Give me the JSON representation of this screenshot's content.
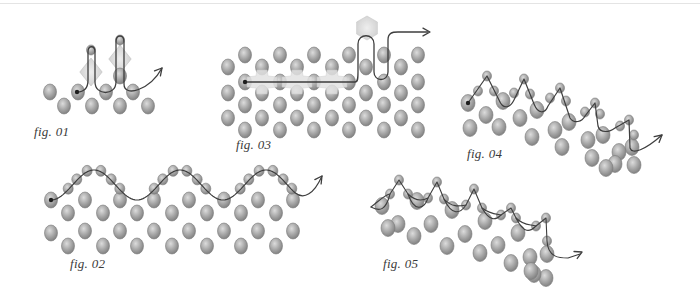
{
  "colors": {
    "bead_light": "#d6d6d6",
    "bead_mid": "#a4a4a4",
    "bead_dark": "#7a7a7a",
    "thread": "#3e3e3e",
    "crystal": "#d9d9d9",
    "background": "#ffffff"
  },
  "figures": [
    {
      "id": "fig01",
      "label": "fig. 01",
      "label_pos": [
        34,
        124
      ],
      "beads": [
        [
          50,
          92
        ],
        [
          78,
          92
        ],
        [
          106,
          92
        ],
        [
          133,
          92
        ],
        [
          64,
          106
        ],
        [
          92,
          106
        ],
        [
          120,
          106
        ],
        [
          148,
          106
        ],
        [
          120,
          76
        ]
      ],
      "small_beads": [
        [
          91,
          50
        ],
        [
          120,
          40
        ]
      ],
      "crystals": [
        [
          91,
          72,
          14
        ],
        [
          120,
          59,
          14
        ]
      ],
      "thread": "M77,92 C84,92 88,88 88,80 L88,52 C88,45 95,45 95,52 L95,82 C95,96 116,96 116,82 L116,42 C116,34 124,34 124,42 L124,84 C124,98 150,90 162,68",
      "arrow": [
        162,
        68,
        -50
      ],
      "start_dot": [
        77,
        92
      ]
    },
    {
      "id": "fig03",
      "label": "fig. 03",
      "label_pos": [
        236,
        137
      ],
      "beads": [
        [
          228,
          67
        ],
        [
          228,
          93
        ],
        [
          228,
          118
        ],
        [
          245,
          55
        ],
        [
          245,
          82
        ],
        [
          245,
          105
        ],
        [
          245,
          130
        ],
        [
          262,
          67
        ],
        [
          262,
          93
        ],
        [
          262,
          118
        ],
        [
          280,
          55
        ],
        [
          280,
          82
        ],
        [
          280,
          105
        ],
        [
          280,
          130
        ],
        [
          297,
          67
        ],
        [
          297,
          93
        ],
        [
          297,
          118
        ],
        [
          314,
          55
        ],
        [
          314,
          82
        ],
        [
          314,
          105
        ],
        [
          314,
          130
        ],
        [
          332,
          67
        ],
        [
          332,
          93
        ],
        [
          332,
          118
        ],
        [
          349,
          55
        ],
        [
          349,
          82
        ],
        [
          349,
          105
        ],
        [
          349,
          130
        ],
        [
          366,
          67
        ],
        [
          366,
          93
        ],
        [
          366,
          118
        ],
        [
          384,
          55
        ],
        [
          384,
          82
        ],
        [
          384,
          105
        ],
        [
          384,
          130
        ],
        [
          401,
          67
        ],
        [
          401,
          93
        ],
        [
          401,
          118
        ],
        [
          418,
          55
        ],
        [
          418,
          82
        ],
        [
          418,
          105
        ],
        [
          418,
          130
        ]
      ],
      "crosses": [
        [
          262,
          82
        ],
        [
          297,
          82
        ],
        [
          332,
          82
        ]
      ],
      "crystals": [
        [
          367,
          28,
          12
        ]
      ],
      "thread": "M245,82 L355,82 C358,82 358,78 358,72 L358,44 C358,33 374,33 374,44 L374,72 C374,82 388,82 388,72 L388,40 C388,33 392,32 398,32 L428,32",
      "arrow": [
        430,
        32,
        0
      ],
      "start_dot": [
        245,
        82
      ]
    },
    {
      "id": "fig04",
      "label": "fig. 04",
      "label_pos": [
        467,
        146
      ],
      "beads": [
        [
          468,
          103
        ],
        [
          503,
          101
        ],
        [
          537,
          110
        ],
        [
          569,
          122
        ],
        [
          603,
          135
        ],
        [
          632,
          147
        ],
        [
          486,
          115
        ],
        [
          520,
          118
        ],
        [
          555,
          130
        ],
        [
          588,
          140
        ],
        [
          619,
          152
        ],
        [
          634,
          165
        ],
        [
          470,
          128
        ],
        [
          499,
          127
        ],
        [
          532,
          137
        ],
        [
          562,
          147
        ],
        [
          592,
          158
        ],
        [
          615,
          164
        ],
        [
          606,
          168
        ]
      ],
      "small_beads": [
        [
          487,
          76
        ],
        [
          478,
          91
        ],
        [
          494,
          91
        ],
        [
          524,
          79
        ],
        [
          514,
          93
        ],
        [
          530,
          94
        ],
        [
          560,
          88
        ],
        [
          550,
          98
        ],
        [
          566,
          101
        ],
        [
          595,
          103
        ],
        [
          585,
          112
        ],
        [
          600,
          114
        ],
        [
          629,
          120
        ],
        [
          620,
          126
        ],
        [
          634,
          135
        ]
      ],
      "thread": "M468,103 L487,76 L499,100 C503,110 510,108 514,100 L524,79 L534,104 C538,114 545,114 548,106 L560,88 L570,118 C574,124 582,122 585,116 L595,103 L598,126 C600,134 610,132 615,128 L629,120 L630,148 C632,155 645,150 662,135",
      "arrow": [
        662,
        135,
        -40
      ],
      "start_dot": [
        468,
        103
      ]
    },
    {
      "id": "fig02",
      "label": "fig. 02",
      "label_pos": [
        70,
        256
      ],
      "beads": [
        [
          51,
          200
        ],
        [
          51,
          233
        ],
        [
          68,
          213
        ],
        [
          68,
          246
        ],
        [
          85,
          200
        ],
        [
          85,
          231
        ],
        [
          103,
          213
        ],
        [
          103,
          246
        ],
        [
          120,
          200
        ],
        [
          120,
          231
        ],
        [
          137,
          213
        ],
        [
          137,
          246
        ],
        [
          154,
          200
        ],
        [
          154,
          231
        ],
        [
          172,
          213
        ],
        [
          172,
          246
        ],
        [
          189,
          200
        ],
        [
          189,
          231
        ],
        [
          207,
          213
        ],
        [
          207,
          246
        ],
        [
          224,
          200
        ],
        [
          224,
          231
        ],
        [
          241,
          213
        ],
        [
          241,
          246
        ],
        [
          258,
          200
        ],
        [
          258,
          231
        ],
        [
          276,
          213
        ],
        [
          276,
          246
        ],
        [
          293,
          200
        ],
        [
          293,
          231
        ]
      ],
      "small_beads": [
        [
          70,
          189
        ],
        [
          82,
          178
        ],
        [
          98,
          170
        ],
        [
          113,
          170
        ],
        [
          128,
          178
        ],
        [
          138,
          188
        ],
        [
          163,
          188
        ],
        [
          173,
          178
        ],
        [
          188,
          170
        ],
        [
          203,
          170
        ],
        [
          218,
          178
        ],
        [
          228,
          188
        ],
        [
          252,
          178
        ],
        [
          263,
          188
        ],
        [
          240,
          188
        ],
        [
          233,
          170
        ],
        [
          249,
          170
        ]
      ],
      "wave": {
        "x0": 51,
        "x1": 296,
        "y_mid": 185,
        "amp": 15,
        "period": 86,
        "phase_start": "trough"
      },
      "arrow": [
        322,
        176,
        -55
      ],
      "start_dot": [
        51,
        200
      ]
    },
    {
      "id": "fig05",
      "label": "fig. 05",
      "label_pos": [
        383,
        256
      ],
      "beads": [
        [
          382,
          206
        ],
        [
          417,
          201
        ],
        [
          452,
          210
        ],
        [
          485,
          221
        ],
        [
          518,
          233
        ],
        [
          547,
          254
        ],
        [
          398,
          224
        ],
        [
          431,
          224
        ],
        [
          465,
          234
        ],
        [
          498,
          245
        ],
        [
          530,
          257
        ],
        [
          546,
          278
        ],
        [
          388,
          228
        ],
        [
          414,
          236
        ],
        [
          447,
          246
        ],
        [
          480,
          253
        ],
        [
          511,
          263
        ],
        [
          534,
          274
        ],
        [
          531,
          271
        ]
      ],
      "small_beads": [
        [
          399,
          180
        ],
        [
          390,
          194
        ],
        [
          408,
          194
        ],
        [
          437,
          182
        ],
        [
          428,
          198
        ],
        [
          444,
          199
        ],
        [
          474,
          189
        ],
        [
          466,
          205
        ],
        [
          482,
          208
        ],
        [
          511,
          208
        ],
        [
          501,
          215
        ],
        [
          516,
          218
        ],
        [
          546,
          218
        ],
        [
          536,
          226
        ],
        [
          547,
          241
        ]
      ],
      "thread": "M371,207 C380,200 386,194 390,194 L399,180 L408,194 C414,200 420,202 428,198 L437,182 L444,199 C452,208 460,206 466,205 L474,189 L482,208 C490,214 496,214 501,215 L511,208 L516,218 C524,226 530,224 536,226 L546,218 L547,241 C548,258 560,258 568,258 L580,254",
      "thread2": "M371,207 C380,212 386,210 390,194 M408,194 C414,212 424,210 428,198 M444,199 C452,216 460,214 466,205 M482,208 C490,222 496,220 501,215 M516,218 C524,234 530,232 536,226",
      "arrow": [
        582,
        252,
        -25
      ],
      "start_dot": [
        371,
        207
      ]
    }
  ]
}
